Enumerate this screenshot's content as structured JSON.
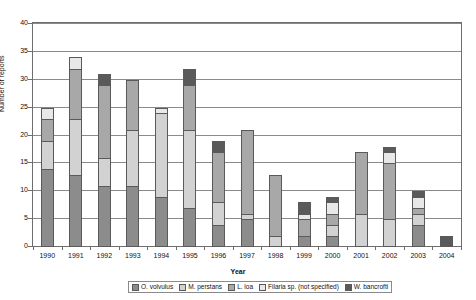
{
  "chart_data": {
    "type": "bar",
    "stacked": true,
    "title": "",
    "xlabel": "Year",
    "ylabel": "Number of reports",
    "ylim": [
      0,
      40
    ],
    "ytick_step": 5,
    "yticks": [
      0,
      5,
      10,
      15,
      20,
      25,
      30,
      35,
      40
    ],
    "grid": true,
    "legend_position": "bottom",
    "categories": [
      "1990",
      "1991",
      "1992",
      "1993",
      "1994",
      "1995",
      "1996",
      "1997",
      "1998",
      "1999",
      "2000",
      "2001",
      "2002",
      "2003",
      "2004"
    ],
    "series": [
      {
        "name": "O. volvulus",
        "color": "#8c8c8c",
        "values": [
          14,
          13,
          11,
          11,
          9,
          7,
          4,
          5,
          0,
          2,
          2,
          0,
          0,
          4,
          0
        ]
      },
      {
        "name": "M. perstans",
        "color": "#d2d2d2",
        "values": [
          5,
          10,
          5,
          10,
          15,
          14,
          4,
          1,
          2,
          0,
          2,
          6,
          5,
          2,
          0
        ]
      },
      {
        "name": "L. loa",
        "color": "#a8a8a8",
        "values": [
          4,
          9,
          13,
          9,
          0,
          8,
          9,
          15,
          11,
          3,
          2,
          11,
          10,
          1,
          0
        ]
      },
      {
        "name": "Filaria sp. (not specified)",
        "color": "#e8e8e8",
        "values": [
          2,
          2,
          0,
          0,
          1,
          0,
          0,
          0,
          0,
          1,
          2,
          0,
          2,
          2,
          0
        ]
      },
      {
        "name": "W. bancrofti",
        "color": "#5a5a5a",
        "values": [
          0,
          0,
          2,
          0,
          0,
          3,
          2,
          0,
          0,
          2,
          1,
          0,
          1,
          1,
          2
        ]
      }
    ],
    "totals": [
      25,
      34,
      31,
      30,
      25,
      32,
      19,
      21,
      13,
      8,
      9,
      17,
      18,
      10,
      2
    ]
  },
  "axes": {
    "y_title": "Number of reports",
    "x_title": "Year"
  }
}
